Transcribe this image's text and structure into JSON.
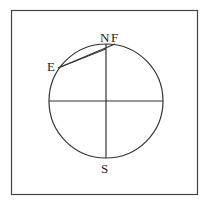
{
  "diagram": {
    "labels": {
      "north": "N",
      "south": "S",
      "e_point": "E",
      "f_point": "F"
    },
    "colors": {
      "stroke": "#333333",
      "background": "#ffffff"
    }
  }
}
